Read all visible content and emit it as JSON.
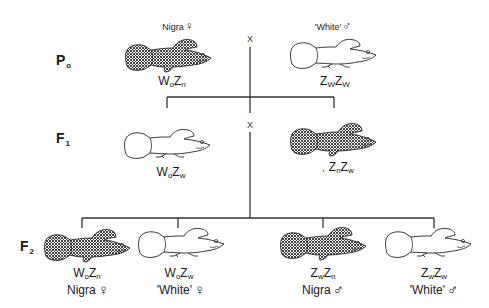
{
  "diagram": {
    "type": "genetic-cross",
    "cross_symbol": "X",
    "colors": {
      "line": "#333333",
      "outline": "#222222",
      "hatch": "#2a2a2a",
      "background": "#ffffff"
    }
  },
  "generations": [
    {
      "id": "P0",
      "label": "P",
      "sub": "o",
      "individuals": [
        {
          "phenotype": "Nigra",
          "sex": "♀",
          "sex_name": "female",
          "genotype": [
            [
              "W",
              "o"
            ],
            [
              "Z",
              "n"
            ]
          ],
          "pattern": "hatched"
        },
        {
          "phenotype": "'White'",
          "sex": "♂",
          "sex_name": "male",
          "genotype": [
            [
              "Z",
              "W"
            ],
            [
              "Z",
              "W"
            ]
          ],
          "pattern": "plain"
        }
      ]
    },
    {
      "id": "F1",
      "label": "F",
      "sub": "1",
      "individuals": [
        {
          "phenotype": "",
          "sex": "",
          "genotype": [
            [
              "W",
              "o"
            ],
            [
              "Z",
              "w"
            ]
          ],
          "pattern": "plain"
        },
        {
          "phenotype": "",
          "sex": "",
          "prefix": ",",
          "genotype": [
            [
              "Z",
              "n"
            ],
            [
              "Z",
              "w"
            ]
          ],
          "pattern": "hatched"
        }
      ]
    },
    {
      "id": "F2",
      "label": "F",
      "sub": "2",
      "individuals": [
        {
          "phenotype": "Nigra",
          "sex": "♀",
          "sex_name": "female",
          "genotype": [
            [
              "W",
              "o"
            ],
            [
              "Z",
              "n"
            ]
          ],
          "pattern": "hatched"
        },
        {
          "phenotype": "'White'",
          "sex": "♀",
          "sex_name": "female",
          "genotype": [
            [
              "W",
              "o"
            ],
            [
              "Z",
              "w"
            ]
          ],
          "pattern": "plain"
        },
        {
          "phenotype": "Nigra",
          "sex": "♂",
          "sex_name": "male",
          "genotype": [
            [
              "Z",
              "w"
            ],
            [
              "Z",
              "n"
            ]
          ],
          "pattern": "hatched"
        },
        {
          "phenotype": "'White'",
          "sex": "♂",
          "sex_name": "male",
          "genotype": [
            [
              "Z",
              "w"
            ],
            [
              "Z",
              "w"
            ]
          ],
          "pattern": "plain"
        }
      ]
    }
  ]
}
